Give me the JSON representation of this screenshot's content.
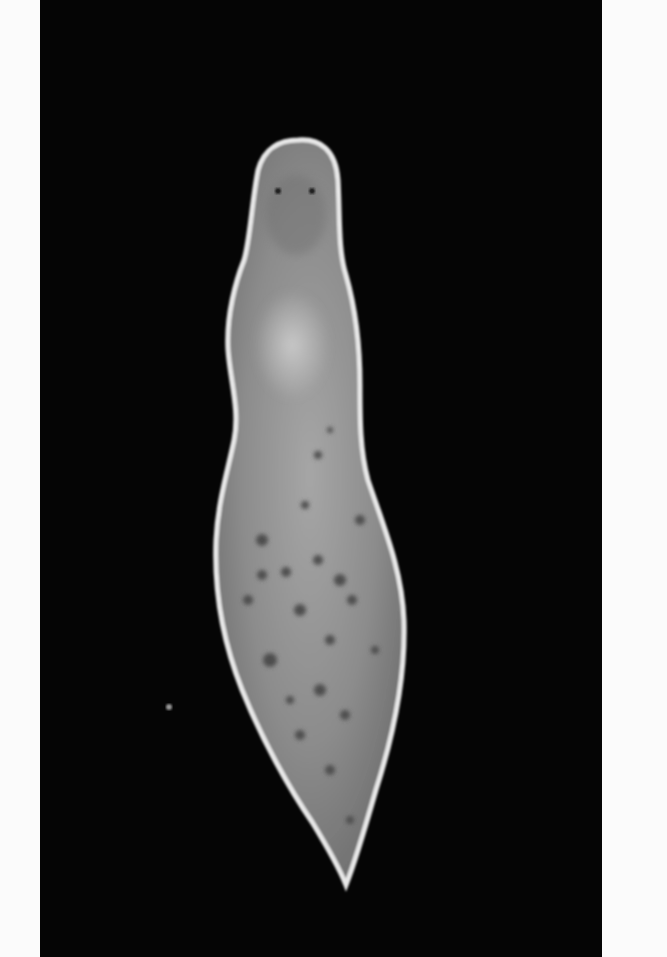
{
  "image": {
    "subject": "planarian flatworm",
    "view": "dorsal, head up",
    "style": "grayscale micrograph",
    "colors": {
      "background": "#050505",
      "margin": "#fbfbfb",
      "body": "#8f8f8f",
      "body_edge": "#e6e6e6",
      "spots": "#4a4a4a"
    },
    "features": [
      "head",
      "eyespots",
      "pharynx-region",
      "pigment-spots",
      "tail"
    ]
  }
}
